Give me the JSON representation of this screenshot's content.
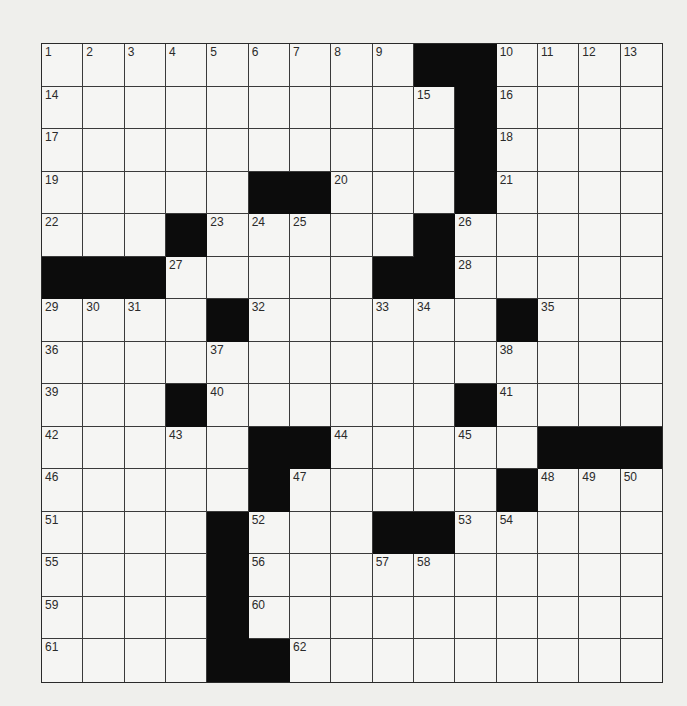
{
  "puzzle": {
    "rows": 15,
    "cols": 15,
    "colors": {
      "background": "#efefec",
      "cell": "#f5f5f3",
      "block": "#0c0c0c",
      "line": "#3a3a3a"
    },
    "grid": [
      "..........##....",
      "..........#....",
      "..........#....",
      ".....##...#....",
      "...#.....#.....",
      "###.....##.....",
      "....#......#...",
      "...............",
      "...#......#....",
      "...#.##...#.###",
      ".....#.....#...",
      "....#...##.....",
      "....#..........",
      "....#..........",
      "....##........."
    ],
    "blocks": [
      [
        0,
        9
      ],
      [
        0,
        10
      ],
      [
        1,
        10
      ],
      [
        2,
        10
      ],
      [
        3,
        5
      ],
      [
        3,
        6
      ],
      [
        3,
        10
      ],
      [
        4,
        3
      ],
      [
        4,
        9
      ],
      [
        5,
        0
      ],
      [
        5,
        1
      ],
      [
        5,
        2
      ],
      [
        5,
        8
      ],
      [
        5,
        9
      ],
      [
        6,
        4
      ],
      [
        6,
        11
      ],
      [
        8,
        3
      ],
      [
        8,
        10
      ],
      [
        9,
        5
      ],
      [
        9,
        6
      ],
      [
        9,
        12
      ],
      [
        9,
        13
      ],
      [
        9,
        14
      ],
      [
        10,
        5
      ],
      [
        10,
        11
      ],
      [
        11,
        4
      ],
      [
        11,
        8
      ],
      [
        11,
        9
      ],
      [
        12,
        4
      ],
      [
        13,
        4
      ],
      [
        14,
        4
      ],
      [
        14,
        5
      ]
    ],
    "numbers": [
      {
        "r": 0,
        "c": 0,
        "n": "1"
      },
      {
        "r": 0,
        "c": 1,
        "n": "2"
      },
      {
        "r": 0,
        "c": 2,
        "n": "3"
      },
      {
        "r": 0,
        "c": 3,
        "n": "4"
      },
      {
        "r": 0,
        "c": 4,
        "n": "5"
      },
      {
        "r": 0,
        "c": 5,
        "n": "6"
      },
      {
        "r": 0,
        "c": 6,
        "n": "7"
      },
      {
        "r": 0,
        "c": 7,
        "n": "8"
      },
      {
        "r": 0,
        "c": 8,
        "n": "9"
      },
      {
        "r": 0,
        "c": 11,
        "n": "10"
      },
      {
        "r": 0,
        "c": 12,
        "n": "11"
      },
      {
        "r": 0,
        "c": 13,
        "n": "12"
      },
      {
        "r": 0,
        "c": 14,
        "n": "13"
      },
      {
        "r": 1,
        "c": 0,
        "n": "14"
      },
      {
        "r": 1,
        "c": 9,
        "n": "15"
      },
      {
        "r": 1,
        "c": 11,
        "n": "16"
      },
      {
        "r": 2,
        "c": 0,
        "n": "17"
      },
      {
        "r": 2,
        "c": 11,
        "n": "18"
      },
      {
        "r": 3,
        "c": 0,
        "n": "19"
      },
      {
        "r": 3,
        "c": 7,
        "n": "20"
      },
      {
        "r": 3,
        "c": 11,
        "n": "21"
      },
      {
        "r": 4,
        "c": 0,
        "n": "22"
      },
      {
        "r": 4,
        "c": 4,
        "n": "23"
      },
      {
        "r": 4,
        "c": 5,
        "n": "24"
      },
      {
        "r": 4,
        "c": 6,
        "n": "25"
      },
      {
        "r": 4,
        "c": 10,
        "n": "26"
      },
      {
        "r": 5,
        "c": 3,
        "n": "27"
      },
      {
        "r": 5,
        "c": 10,
        "n": "28"
      },
      {
        "r": 6,
        "c": 0,
        "n": "29"
      },
      {
        "r": 6,
        "c": 1,
        "n": "30"
      },
      {
        "r": 6,
        "c": 2,
        "n": "31"
      },
      {
        "r": 6,
        "c": 5,
        "n": "32"
      },
      {
        "r": 6,
        "c": 8,
        "n": "33"
      },
      {
        "r": 6,
        "c": 9,
        "n": "34"
      },
      {
        "r": 6,
        "c": 12,
        "n": "35"
      },
      {
        "r": 7,
        "c": 0,
        "n": "36"
      },
      {
        "r": 7,
        "c": 4,
        "n": "37"
      },
      {
        "r": 7,
        "c": 11,
        "n": "38"
      },
      {
        "r": 8,
        "c": 0,
        "n": "39"
      },
      {
        "r": 8,
        "c": 4,
        "n": "40"
      },
      {
        "r": 8,
        "c": 11,
        "n": "41"
      },
      {
        "r": 9,
        "c": 0,
        "n": "42"
      },
      {
        "r": 9,
        "c": 3,
        "n": "43"
      },
      {
        "r": 9,
        "c": 7,
        "n": "44"
      },
      {
        "r": 9,
        "c": 10,
        "n": "45"
      },
      {
        "r": 10,
        "c": 0,
        "n": "46"
      },
      {
        "r": 10,
        "c": 6,
        "n": "47"
      },
      {
        "r": 10,
        "c": 12,
        "n": "48"
      },
      {
        "r": 10,
        "c": 13,
        "n": "49"
      },
      {
        "r": 10,
        "c": 14,
        "n": "50"
      },
      {
        "r": 11,
        "c": 0,
        "n": "51"
      },
      {
        "r": 11,
        "c": 5,
        "n": "52"
      },
      {
        "r": 11,
        "c": 10,
        "n": "53"
      },
      {
        "r": 11,
        "c": 11,
        "n": "54"
      },
      {
        "r": 12,
        "c": 0,
        "n": "55"
      },
      {
        "r": 12,
        "c": 5,
        "n": "56"
      },
      {
        "r": 12,
        "c": 8,
        "n": "57"
      },
      {
        "r": 12,
        "c": 9,
        "n": "58"
      },
      {
        "r": 13,
        "c": 0,
        "n": "59"
      },
      {
        "r": 13,
        "c": 5,
        "n": "60"
      },
      {
        "r": 14,
        "c": 0,
        "n": "61"
      },
      {
        "r": 14,
        "c": 6,
        "n": "62"
      }
    ]
  }
}
